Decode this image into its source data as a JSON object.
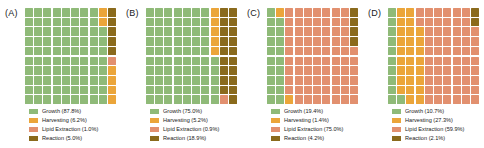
{
  "figure": {
    "title": "",
    "n_panels": 4,
    "grid_rows": 10,
    "grid_cols": 10,
    "background": "#ffffff"
  },
  "colors": {
    "growth": "#8fba78",
    "harvesting": "#eba53a",
    "lipid_extraction": "#e2906f",
    "reaction": "#8a6a1c"
  },
  "category_order": [
    "growth",
    "harvesting",
    "lipid_extraction",
    "reaction"
  ],
  "chart_data": {
    "type": "waffle",
    "title": "",
    "xlabel": "",
    "ylabel": "",
    "grid": {
      "rows": 10,
      "cols": 10,
      "total_cells": 100
    },
    "legend_position": "below",
    "categories": [
      "Growth",
      "Harvesting",
      "Lipid Extraction",
      "Reaction"
    ],
    "panels": [
      {
        "label": "(A)",
        "values": [
          87.8,
          6.2,
          1.0,
          5.0
        ],
        "series": [
          {
            "name": "Growth",
            "value": 87.8,
            "color": "#8fba78",
            "cells": 88
          },
          {
            "name": "Harvesting",
            "value": 6.2,
            "color": "#eba53a",
            "cells": 6
          },
          {
            "name": "Lipid Extraction",
            "value": 1.0,
            "color": "#e2906f",
            "cells": 1
          },
          {
            "name": "Reaction",
            "value": 5.0,
            "color": "#8a6a1c",
            "cells": 5
          }
        ],
        "legend": [
          {
            "label": "Growth (87.8%)",
            "color": "#8fba78"
          },
          {
            "label": "Harvesting (6.2%)",
            "color": "#eba53a"
          },
          {
            "label": "Lipid Extraction (1.0%)",
            "color": "#e2906f"
          },
          {
            "label": "Reaction (5.0%)",
            "color": "#8a6a1c"
          }
        ]
      },
      {
        "label": "(B)",
        "values": [
          75.0,
          5.2,
          0.9,
          18.9
        ],
        "series": [
          {
            "name": "Growth",
            "value": 75.0,
            "color": "#8fba78",
            "cells": 75
          },
          {
            "name": "Harvesting",
            "value": 5.2,
            "color": "#eba53a",
            "cells": 5
          },
          {
            "name": "Lipid Extraction",
            "value": 0.9,
            "color": "#e2906f",
            "cells": 1
          },
          {
            "name": "Reaction",
            "value": 18.9,
            "color": "#8a6a1c",
            "cells": 19
          }
        ],
        "legend": [
          {
            "label": "Growth (75.0%)",
            "color": "#8fba78"
          },
          {
            "label": "Harvesting (5.2%)",
            "color": "#eba53a"
          },
          {
            "label": "Lipid Extraction (0.9%)",
            "color": "#e2906f"
          },
          {
            "label": "Reaction (18.9%)",
            "color": "#8a6a1c"
          }
        ]
      },
      {
        "label": "(C)",
        "values": [
          19.4,
          1.4,
          75.0,
          4.2
        ],
        "series": [
          {
            "name": "Growth",
            "value": 19.4,
            "color": "#8fba78",
            "cells": 19
          },
          {
            "name": "Harvesting",
            "value": 1.4,
            "color": "#eba53a",
            "cells": 2
          },
          {
            "name": "Lipid Extraction",
            "value": 75.0,
            "color": "#e2906f",
            "cells": 75
          },
          {
            "name": "Reaction",
            "value": 4.2,
            "color": "#8a6a1c",
            "cells": 4
          }
        ],
        "legend": [
          {
            "label": "Growth (19.4%)",
            "color": "#8fba78"
          },
          {
            "label": "Harvesting (1.4%)",
            "color": "#eba53a"
          },
          {
            "label": "Lipid Extraction (75.0%)",
            "color": "#e2906f"
          },
          {
            "label": "Reaction (4.2%)",
            "color": "#8a6a1c"
          }
        ]
      },
      {
        "label": "(D)",
        "values": [
          10.7,
          27.3,
          59.9,
          2.1
        ],
        "series": [
          {
            "name": "Growth",
            "value": 10.7,
            "color": "#8fba78",
            "cells": 11
          },
          {
            "name": "Harvesting",
            "value": 27.3,
            "color": "#eba53a",
            "cells": 27
          },
          {
            "name": "Lipid Extraction",
            "value": 59.9,
            "color": "#e2906f",
            "cells": 60
          },
          {
            "name": "Reaction",
            "value": 2.1,
            "color": "#8a6a1c",
            "cells": 2
          }
        ],
        "legend": [
          {
            "label": "Growth (10.7%)",
            "color": "#8fba78"
          },
          {
            "label": "Harvesting (27.3%)",
            "color": "#eba53a"
          },
          {
            "label": "Lipid Extraction (59.9%)",
            "color": "#e2906f"
          },
          {
            "label": "Reaction (2.1%)",
            "color": "#8a6a1c"
          }
        ]
      }
    ]
  }
}
